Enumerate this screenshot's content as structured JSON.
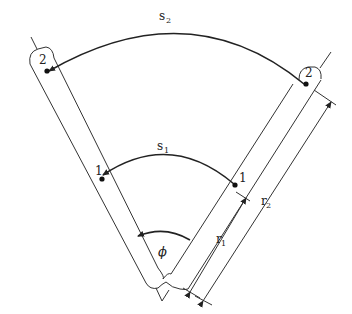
{
  "diagram": {
    "type": "two-arm hinged linkage with arc lengths",
    "labels": {
      "s2": {
        "main": "s",
        "sub": "2"
      },
      "s1": {
        "main": "s",
        "sub": "1"
      },
      "r1": {
        "main": "r",
        "sub": "1"
      },
      "r2": {
        "main": "r",
        "sub": "2"
      },
      "phi": "ϕ",
      "left_point_outer": "2",
      "left_point_inner": "1",
      "right_point_outer": "2",
      "right_point_inner": "1"
    },
    "colors": {
      "line": "#333333",
      "background": "#ffffff"
    }
  }
}
